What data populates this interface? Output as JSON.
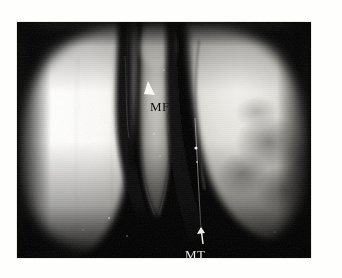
{
  "figure": {
    "kind": "arthroscopic-photograph",
    "modality": "knee arthroscopy",
    "background_color": "#fefefc",
    "photo": {
      "background_color": "#000000",
      "left_px": 17,
      "top_px": 22,
      "width_px": 294,
      "height_px": 236
    },
    "annotations": [
      {
        "id": "mf",
        "text": "MF",
        "meaning": "medial femoral condyle",
        "color": "#0d0d0d",
        "marker": "white-arrowhead",
        "marker_direction": "up-left",
        "x_px": 133,
        "y_px": 77
      },
      {
        "id": "mt",
        "text": "MT",
        "meaning": "medial tibial plateau",
        "color": "#eceae4",
        "marker": "white-arrow",
        "marker_direction": "up",
        "x_px": 168,
        "y_px": 225
      }
    ],
    "structures": [
      {
        "name": "left-condyle-mass",
        "tone": "bright-white",
        "color": "#f6f5f1"
      },
      {
        "name": "right-condyle-mass",
        "tone": "gray-white",
        "color": "#cfcdc8"
      },
      {
        "name": "central-meniscal-band",
        "tone": "light-gray",
        "color": "#b9b7b0"
      },
      {
        "name": "left-fissure",
        "tone": "dark",
        "color": "#101010"
      },
      {
        "name": "right-fissure",
        "tone": "dark",
        "color": "#0a0a0a"
      },
      {
        "name": "joint-space-shadow",
        "tone": "black",
        "color": "#000000"
      }
    ]
  }
}
